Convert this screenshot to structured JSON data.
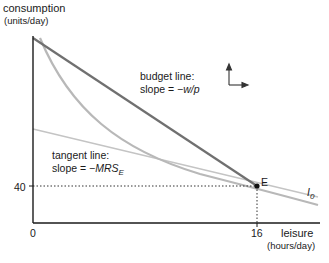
{
  "axes": {
    "y_label": "consumption",
    "y_units": "(units/day)",
    "x_label": "leisure",
    "x_units": "(hours/day)",
    "origin_label": "0",
    "y_tick": "40",
    "x_tick": "16"
  },
  "annotations": {
    "budget_title": "budget line:",
    "budget_slope_prefix": "slope = −",
    "budget_slope_var": "w/p",
    "tangent_title": "tangent line:",
    "tangent_slope_prefix": "slope = −",
    "tangent_slope_var": "MRS",
    "tangent_slope_sub": "E",
    "point_label": "E",
    "curve_label": "I",
    "curve_sub": "0"
  },
  "colors": {
    "axis": "#1a1a1a",
    "budget_line": "#707070",
    "indifference_curve": "#b8b8b8",
    "tangent_line": "#c4c4c4"
  },
  "icons": {
    "direction_arrows": "up-right-arrows-icon"
  }
}
